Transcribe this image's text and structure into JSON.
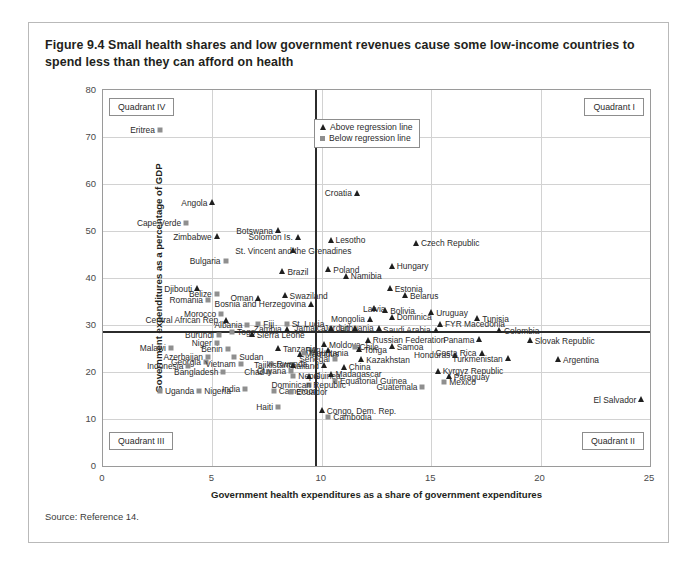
{
  "figure": {
    "title": "Figure 9.4  Small health shares and low government revenues cause some low-income countries to spend less than they can afford on health",
    "source": "Source: Reference 14."
  },
  "legend": {
    "above_label": "Above regression line",
    "below_label": "Below regression line",
    "above_marker": "triangle-marker",
    "below_marker": "square-marker"
  },
  "quadrants": {
    "q1": "Quadrant I",
    "q2": "Quadrant II",
    "q3": "Quadrant III",
    "q4": "Quadrant IV"
  },
  "chart_data": {
    "type": "scatter",
    "title": "Figure 9.4  Small health shares and low government revenues cause some low-income countries to spend less than they can afford on health",
    "xlabel": "Government health expenditures as a share of government expenditures",
    "ylabel": "Government expenditures as a percentage of GDP",
    "xlim": [
      0,
      25
    ],
    "ylim": [
      0,
      80
    ],
    "xticks": [
      0,
      5,
      10,
      15,
      20,
      25
    ],
    "yticks": [
      0,
      10,
      20,
      30,
      40,
      50,
      60,
      70,
      80
    ],
    "grid": true,
    "legend_position": "top-center",
    "reference_lines": {
      "x": 9.7,
      "y": 28.7
    },
    "series": [
      {
        "name": "Above regression line",
        "marker": "triangle"
      },
      {
        "name": "Below regression line",
        "marker": "square"
      }
    ],
    "points": [
      {
        "label": "Eritrea",
        "x": 2.6,
        "y": 71.5,
        "group": "below",
        "lp": "l"
      },
      {
        "label": "Angola",
        "x": 5.0,
        "y": 56.0,
        "group": "above",
        "lp": "l"
      },
      {
        "label": "Cape Verde",
        "x": 3.8,
        "y": 51.8,
        "group": "below",
        "lp": "l"
      },
      {
        "label": "Zimbabwe",
        "x": 5.2,
        "y": 48.8,
        "group": "above",
        "lp": "l"
      },
      {
        "label": "Botswana",
        "x": 8.0,
        "y": 50.1,
        "group": "above",
        "lp": "l"
      },
      {
        "label": "Solomon Is.",
        "x": 8.9,
        "y": 48.7,
        "group": "above",
        "lp": "l"
      },
      {
        "label": "Lesotho",
        "x": 10.4,
        "y": 48.0,
        "group": "above",
        "lp": "r"
      },
      {
        "label": "St. Vincent and the Grenadines",
        "x": 8.7,
        "y": 45.8,
        "group": "above",
        "lp": "c"
      },
      {
        "label": "Croatia",
        "x": 11.6,
        "y": 58.0,
        "group": "above",
        "lp": "l"
      },
      {
        "label": "Czech Republic",
        "x": 14.3,
        "y": 47.4,
        "group": "above",
        "lp": "r"
      },
      {
        "label": "Bulgaria",
        "x": 5.6,
        "y": 43.6,
        "group": "below",
        "lp": "l"
      },
      {
        "label": "Brazil",
        "x": 8.2,
        "y": 41.3,
        "group": "above",
        "lp": "r"
      },
      {
        "label": "Poland",
        "x": 10.3,
        "y": 41.8,
        "group": "above",
        "lp": "r"
      },
      {
        "label": "Namibia",
        "x": 11.1,
        "y": 40.4,
        "group": "above",
        "lp": "r"
      },
      {
        "label": "Hungary",
        "x": 13.2,
        "y": 42.5,
        "group": "above",
        "lp": "r"
      },
      {
        "label": "Djibouti",
        "x": 4.3,
        "y": 37.7,
        "group": "above",
        "lp": "l"
      },
      {
        "label": "Belize",
        "x": 5.2,
        "y": 36.5,
        "group": "below",
        "lp": "l"
      },
      {
        "label": "Romania",
        "x": 4.8,
        "y": 35.4,
        "group": "below",
        "lp": "l"
      },
      {
        "label": "Oman",
        "x": 7.1,
        "y": 35.7,
        "group": "above",
        "lp": "l"
      },
      {
        "label": "Swaziland",
        "x": 8.3,
        "y": 36.2,
        "group": "above",
        "lp": "r"
      },
      {
        "label": "Bosnia and Herzegovina",
        "x": 9.5,
        "y": 34.4,
        "group": "above",
        "lp": "l"
      },
      {
        "label": "Estonia",
        "x": 13.1,
        "y": 37.7,
        "group": "above",
        "lp": "r"
      },
      {
        "label": "Belarus",
        "x": 13.8,
        "y": 36.2,
        "group": "above",
        "lp": "r"
      },
      {
        "label": "Latvia",
        "x": 12.4,
        "y": 33.5,
        "group": "above",
        "lp": "c"
      },
      {
        "label": "Morocco",
        "x": 5.4,
        "y": 32.4,
        "group": "below",
        "lp": "l"
      },
      {
        "label": "Central African Rep.",
        "x": 5.6,
        "y": 31.0,
        "group": "above",
        "lp": "l"
      },
      {
        "label": "Albania",
        "x": 6.6,
        "y": 30.0,
        "group": "below",
        "lp": "l"
      },
      {
        "label": "Fiji",
        "x": 7.1,
        "y": 30.3,
        "group": "below",
        "lp": "r"
      },
      {
        "label": "St. Lucia",
        "x": 8.4,
        "y": 30.3,
        "group": "below",
        "lp": "r"
      },
      {
        "label": "Zambia",
        "x": 8.4,
        "y": 29.1,
        "group": "above",
        "lp": "l"
      },
      {
        "label": "Bolivia",
        "x": 12.9,
        "y": 33.0,
        "group": "above",
        "lp": "r"
      },
      {
        "label": "Dominica",
        "x": 13.2,
        "y": 31.6,
        "group": "above",
        "lp": "r"
      },
      {
        "label": "Mongolia",
        "x": 12.2,
        "y": 31.2,
        "group": "above",
        "lp": "l"
      },
      {
        "label": "Lithuania",
        "x": 12.6,
        "y": 29.3,
        "group": "above",
        "lp": "l"
      },
      {
        "label": "Jordan",
        "x": 11.5,
        "y": 29.3,
        "group": "above",
        "lp": "l"
      },
      {
        "label": "Jamaica",
        "x": 10.4,
        "y": 29.3,
        "group": "above",
        "lp": "l"
      },
      {
        "label": "Uruguay",
        "x": 15.0,
        "y": 32.6,
        "group": "above",
        "lp": "r"
      },
      {
        "label": "Tunisia",
        "x": 17.1,
        "y": 31.3,
        "group": "above",
        "lp": "r"
      },
      {
        "label": "FYR Macedonia",
        "x": 15.4,
        "y": 30.2,
        "group": "above",
        "lp": "r"
      },
      {
        "label": "Saudi Arabia",
        "x": 15.2,
        "y": 28.9,
        "group": "above",
        "lp": "l"
      },
      {
        "label": "Colombia",
        "x": 18.1,
        "y": 28.8,
        "group": "above",
        "lp": "r"
      },
      {
        "label": "Togo",
        "x": 5.9,
        "y": 28.6,
        "group": "below",
        "lp": "r"
      },
      {
        "label": "Burundi",
        "x": 5.3,
        "y": 27.9,
        "group": "below",
        "lp": "l"
      },
      {
        "label": "Sierra Leone",
        "x": 6.8,
        "y": 27.9,
        "group": "above",
        "lp": "r"
      },
      {
        "label": "Russian Federation",
        "x": 12.1,
        "y": 26.8,
        "group": "above",
        "lp": "r"
      },
      {
        "label": "Panama",
        "x": 17.2,
        "y": 26.9,
        "group": "above",
        "lp": "l"
      },
      {
        "label": "Slovak Republic",
        "x": 19.5,
        "y": 26.7,
        "group": "above",
        "lp": "r"
      },
      {
        "label": "Moldova",
        "x": 10.1,
        "y": 25.8,
        "group": "above",
        "lp": "r"
      },
      {
        "label": "Chile",
        "x": 11.5,
        "y": 25.4,
        "group": "below",
        "lp": "r"
      },
      {
        "label": "Tonga",
        "x": 11.7,
        "y": 24.7,
        "group": "above",
        "lp": "r"
      },
      {
        "label": "Samoa",
        "x": 13.2,
        "y": 25.4,
        "group": "above",
        "lp": "r"
      },
      {
        "label": "Peru",
        "x": 10.3,
        "y": 24.6,
        "group": "above",
        "lp": "l"
      },
      {
        "label": "Malawi",
        "x": 3.1,
        "y": 25.1,
        "group": "below",
        "lp": "l"
      },
      {
        "label": "Niger",
        "x": 5.2,
        "y": 26.2,
        "group": "below",
        "lp": "l"
      },
      {
        "label": "Benin",
        "x": 5.7,
        "y": 25.0,
        "group": "below",
        "lp": "l"
      },
      {
        "label": "Tanzania",
        "x": 8.0,
        "y": 25.0,
        "group": "above",
        "lp": "r"
      },
      {
        "label": "Mauritius",
        "x": 9.0,
        "y": 23.8,
        "group": "above",
        "lp": "r"
      },
      {
        "label": "Azerbaijan",
        "x": 4.8,
        "y": 23.2,
        "group": "below",
        "lp": "l"
      },
      {
        "label": "Georgia",
        "x": 4.7,
        "y": 22.2,
        "group": "below",
        "lp": "l"
      },
      {
        "label": "Sudan",
        "x": 6.0,
        "y": 23.1,
        "group": "below",
        "lp": "r"
      },
      {
        "label": "Mauritania",
        "x": 9.2,
        "y": 24.1,
        "group": "below",
        "lp": "r"
      },
      {
        "label": "Senegal",
        "x": 10.6,
        "y": 22.8,
        "group": "below",
        "lp": "l"
      },
      {
        "label": "Kazakhstan",
        "x": 11.8,
        "y": 22.6,
        "group": "above",
        "lp": "r"
      },
      {
        "label": "Honduras",
        "x": 16.1,
        "y": 23.6,
        "group": "above",
        "lp": "l"
      },
      {
        "label": "Costa Rica",
        "x": 17.3,
        "y": 24.0,
        "group": "above",
        "lp": "l"
      },
      {
        "label": "Turkmenistan",
        "x": 18.5,
        "y": 22.8,
        "group": "above",
        "lp": "l"
      },
      {
        "label": "Argentina",
        "x": 20.8,
        "y": 22.6,
        "group": "above",
        "lp": "r"
      },
      {
        "label": "Indonesia",
        "x": 3.9,
        "y": 21.2,
        "group": "below",
        "lp": "l"
      },
      {
        "label": "Vietnam",
        "x": 6.3,
        "y": 21.8,
        "group": "below",
        "lp": "l"
      },
      {
        "label": "Rwanda",
        "x": 7.7,
        "y": 21.7,
        "group": "below",
        "lp": "r"
      },
      {
        "label": "Tajikistan",
        "x": 8.7,
        "y": 21.4,
        "group": "above",
        "lp": "l"
      },
      {
        "label": "Thailand",
        "x": 10.1,
        "y": 21.3,
        "group": "above",
        "lp": "l"
      },
      {
        "label": "China",
        "x": 11.0,
        "y": 21.0,
        "group": "above",
        "lp": "r"
      },
      {
        "label": "Bangladesh",
        "x": 5.5,
        "y": 19.9,
        "group": "below",
        "lp": "l"
      },
      {
        "label": "Chad",
        "x": 7.6,
        "y": 20.0,
        "group": "below",
        "lp": "l"
      },
      {
        "label": "Guyana",
        "x": 8.6,
        "y": 20.3,
        "group": "below",
        "lp": "l"
      },
      {
        "label": "Nepal",
        "x": 8.7,
        "y": 19.1,
        "group": "below",
        "lp": "r"
      },
      {
        "label": "Guinea",
        "x": 9.4,
        "y": 19.1,
        "group": "above",
        "lp": "r"
      },
      {
        "label": "Madagascar",
        "x": 10.4,
        "y": 19.5,
        "group": "above",
        "lp": "r"
      },
      {
        "label": "Equatorial Guinea",
        "x": 10.6,
        "y": 18.1,
        "group": "below",
        "lp": "r"
      },
      {
        "label": "Kyrgyz Republic",
        "x": 15.3,
        "y": 20.2,
        "group": "above",
        "lp": "r"
      },
      {
        "label": "Paraguay",
        "x": 15.8,
        "y": 19.0,
        "group": "above",
        "lp": "r"
      },
      {
        "label": "Mexico",
        "x": 15.6,
        "y": 17.8,
        "group": "below",
        "lp": "r"
      },
      {
        "label": "Guatemala",
        "x": 14.6,
        "y": 16.8,
        "group": "below",
        "lp": "l"
      },
      {
        "label": "Uganda",
        "x": 2.6,
        "y": 16.0,
        "group": "below",
        "lp": "r"
      },
      {
        "label": "Nigeria",
        "x": 4.4,
        "y": 16.0,
        "group": "below",
        "lp": "r"
      },
      {
        "label": "India",
        "x": 6.5,
        "y": 16.4,
        "group": "below",
        "lp": "l"
      },
      {
        "label": "Cameroon",
        "x": 7.8,
        "y": 16.0,
        "group": "below",
        "lp": "r"
      },
      {
        "label": "Dominican Republic",
        "x": 9.4,
        "y": 17.3,
        "group": "below",
        "lp": "c"
      },
      {
        "label": "Ecuador",
        "x": 8.6,
        "y": 15.7,
        "group": "below",
        "lp": "r"
      },
      {
        "label": "El Salvador",
        "x": 24.6,
        "y": 14.1,
        "group": "above",
        "lp": "l"
      },
      {
        "label": "Haiti",
        "x": 8.0,
        "y": 12.6,
        "group": "below",
        "lp": "l"
      },
      {
        "label": "Congo, Dem. Rep.",
        "x": 10.0,
        "y": 11.8,
        "group": "above",
        "lp": "r"
      },
      {
        "label": "Cambodia",
        "x": 10.3,
        "y": 10.5,
        "group": "below",
        "lp": "r"
      }
    ]
  }
}
